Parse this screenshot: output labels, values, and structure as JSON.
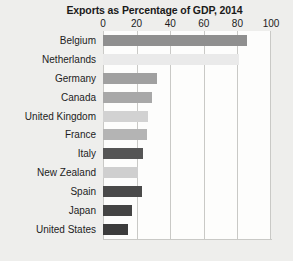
{
  "chart_data": {
    "type": "bar",
    "orientation": "horizontal",
    "title": "Exports as Percentage of GDP, 2014",
    "xlabel": "",
    "ylabel": "",
    "xlim": [
      0,
      100
    ],
    "xticks": [
      0,
      20,
      40,
      60,
      80,
      100
    ],
    "xtick_labels": [
      "0",
      "20",
      "40",
      "60",
      "80",
      "100"
    ],
    "grid": true,
    "legend": false,
    "categories": [
      "Belgium",
      "Netherlands",
      "Germany",
      "Canada",
      "United Kingdom",
      "France",
      "Italy",
      "New Zealand",
      "Spain",
      "Japan",
      "United States"
    ],
    "values": [
      86,
      81,
      32,
      29,
      27,
      26,
      24,
      21,
      23,
      17,
      15
    ],
    "bar_colors": [
      "#8f8f8f",
      "#eaeaea",
      "#a0a0a0",
      "#a8a8a8",
      "#d2d2d2",
      "#b4b4b4",
      "#555555",
      "#cfcfcf",
      "#4a4a4a",
      "#444444",
      "#3c3c3c"
    ],
    "plot_background": "#fdfdfc",
    "grid_color": "#c9c9c6",
    "figure_background": "#eeeeec"
  }
}
